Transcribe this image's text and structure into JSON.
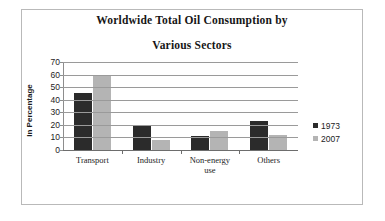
{
  "chart_data": {
    "type": "bar",
    "title": "Worldwide Total Oil Consumption by Various Sectors",
    "title_line1": "Worldwide Total Oil Consumption by",
    "title_line2": "Various Sectors",
    "xlabel": "",
    "ylabel": "In Percentage",
    "ylim": [
      0,
      70
    ],
    "ytick_step": 10,
    "yticks": [
      "70",
      "60",
      "50",
      "40",
      "30",
      "20",
      "10",
      "0"
    ],
    "grid": true,
    "legend_position": "right",
    "categories": [
      "Transport",
      "Industry",
      "Non-energy use",
      "Others"
    ],
    "category_lines": [
      [
        "Transport"
      ],
      [
        "Industry"
      ],
      [
        "Non-energy",
        "use"
      ],
      [
        "Others"
      ]
    ],
    "series": [
      {
        "name": "1973",
        "color": "#2b2b2b",
        "values": [
          45,
          19,
          11,
          23
        ]
      },
      {
        "name": "2007",
        "color": "#b4b4b4",
        "values": [
          60,
          8,
          15,
          12
        ]
      }
    ]
  },
  "colors": {
    "series_1973": "#2b2b2b",
    "series_2007": "#b4b4b4",
    "gridline": "#9a9a9a",
    "axis": "#6d6d6d",
    "frame": "#b9b9b9",
    "text": "#1c1c1c",
    "background": "#ffffff"
  }
}
